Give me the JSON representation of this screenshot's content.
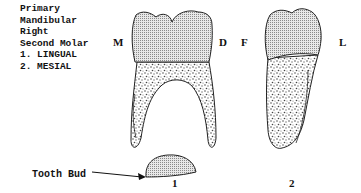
{
  "title": {
    "lines": [
      "Primary",
      "Mandibular",
      "Right",
      "Second Molar",
      "1. LINGUAL",
      "2. MESIAL"
    ]
  },
  "views": [
    {
      "number": "1",
      "left_label": "M",
      "right_label": "D",
      "view": "lingual"
    },
    {
      "number": "2",
      "left_label": "F",
      "right_label": "L",
      "view": "mesial"
    }
  ],
  "annotations": {
    "tooth_bud": "Tooth Bud"
  },
  "colors": {
    "enamel_fill": "#bdbdbd",
    "root_fill": "#d9d9d9",
    "outline": "#222222"
  }
}
